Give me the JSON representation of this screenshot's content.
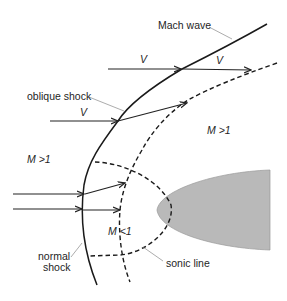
{
  "figure": {
    "labels": {
      "mach_wave": "Mach wave",
      "oblique_shock": "oblique shock",
      "normal_shock_line1": "normal",
      "normal_shock_line2": "shock",
      "sonic_line": "sonic line",
      "supersonic_left": "M >1",
      "supersonic_right": "M >1",
      "subsonic": "M <1",
      "velocity": "V"
    },
    "colors": {
      "line": "#1a1a1a",
      "body_fill": "#b9b9b9",
      "leader": "#888888"
    }
  }
}
